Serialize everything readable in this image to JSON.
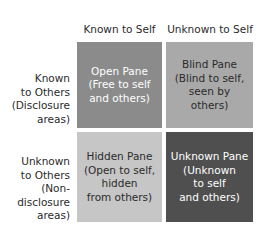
{
  "diagram": {
    "type": "johari-window",
    "columns": [
      {
        "label": "Known to Self"
      },
      {
        "label": "Unknown to Self"
      }
    ],
    "rows": [
      {
        "lines": [
          "Known",
          "to Others",
          "(Disclosure",
          "areas)"
        ]
      },
      {
        "lines": [
          "Unknown",
          "to Others",
          "(Non-",
          "disclosure",
          "areas)"
        ]
      }
    ],
    "panes": [
      {
        "id": "open",
        "lines": [
          "Open Pane",
          "(Free to self",
          "and others)"
        ],
        "color": "#8b8b8b",
        "text_color": "#ffffff"
      },
      {
        "id": "blind",
        "lines": [
          "Blind Pane",
          "(Blind to self,",
          "seen by others)"
        ],
        "color": "#a9a9a9",
        "text_color": "#2b2b2b"
      },
      {
        "id": "hidden",
        "lines": [
          "Hidden Pane",
          "(Open to self,",
          "hidden",
          "from others)"
        ],
        "color": "#c6c6c6",
        "text_color": "#2b2b2b"
      },
      {
        "id": "unknown",
        "lines": [
          "Unknown Pane",
          "(Unknown",
          "to self",
          "and others)"
        ],
        "color": "#4f4f4f",
        "text_color": "#ffffff"
      }
    ]
  }
}
